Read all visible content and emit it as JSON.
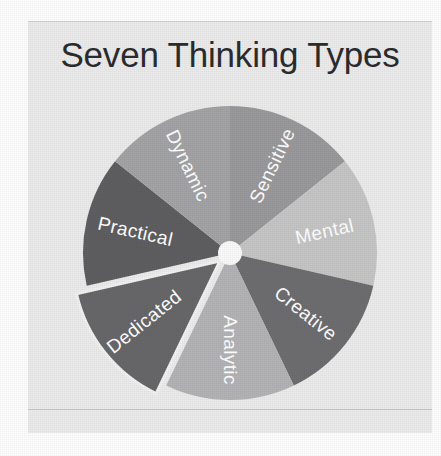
{
  "figure": {
    "title": "Seven Thinking Types",
    "background_color": "#ffffff",
    "panel_color": "#ececed",
    "title_color": "#2c2c2e",
    "label_color": "#ffffff",
    "hub_color": "#fbfbfb"
  },
  "chart_data": {
    "type": "pie",
    "title": "Seven Thinking Types",
    "xlabel": "",
    "ylabel": "",
    "legend_position": "none",
    "grid": false,
    "labels_on_slices": true,
    "equal_slices": true,
    "slice_count": 7,
    "categories": [
      "Sensitive",
      "Mental",
      "Creative",
      "Analytic",
      "Dedicated",
      "Practical",
      "Dynamic"
    ],
    "values": [
      14.3,
      14.3,
      14.3,
      14.3,
      14.3,
      14.3,
      14.3
    ],
    "colors": [
      "#9a9a9c",
      "#c6c6c7",
      "#6e6e71",
      "#b4b4b6",
      "#68686b",
      "#5f5f62",
      "#a4a4a6"
    ],
    "slices": [
      {
        "label": "Sensitive",
        "value": 14.3,
        "color": "#9a9a9c",
        "start_angle_deg": 0,
        "end_angle_deg": 51.43,
        "exploded": false
      },
      {
        "label": "Mental",
        "value": 14.3,
        "color": "#c6c6c7",
        "start_angle_deg": 51.43,
        "end_angle_deg": 102.86,
        "exploded": false
      },
      {
        "label": "Creative",
        "value": 14.3,
        "color": "#6e6e71",
        "start_angle_deg": 102.86,
        "end_angle_deg": 154.29,
        "exploded": false
      },
      {
        "label": "Analytic",
        "value": 14.3,
        "color": "#b4b4b6",
        "start_angle_deg": 154.29,
        "end_angle_deg": 205.71,
        "exploded": false
      },
      {
        "label": "Dedicated",
        "value": 14.3,
        "color": "#68686b",
        "start_angle_deg": 205.71,
        "end_angle_deg": 257.14,
        "exploded": true
      },
      {
        "label": "Practical",
        "value": 14.3,
        "color": "#5f5f62",
        "start_angle_deg": 257.14,
        "end_angle_deg": 308.57,
        "exploded": false
      },
      {
        "label": "Dynamic",
        "value": 14.3,
        "color": "#a4a4a6",
        "start_angle_deg": 308.57,
        "end_angle_deg": 360,
        "exploded": false
      }
    ]
  },
  "geometry": {
    "center_x": 202,
    "center_y": 232,
    "radius": 147,
    "hub_radius": 12,
    "explode_offset": 13,
    "label_radius_ratio": 0.66
  }
}
